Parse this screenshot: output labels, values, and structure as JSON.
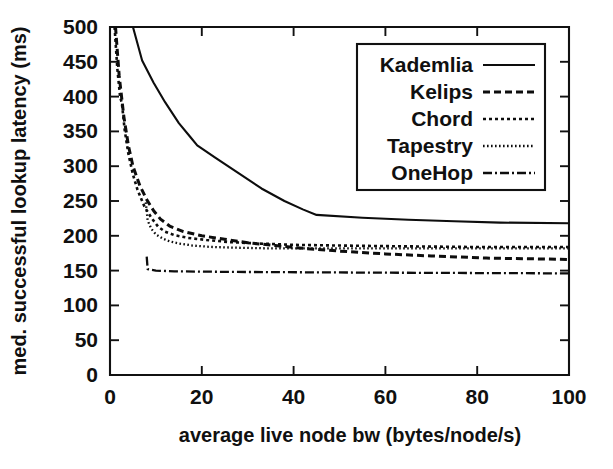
{
  "chart_data": {
    "type": "line",
    "title": "",
    "xlabel": "average live node bw (bytes/node/s)",
    "ylabel": "med. successful lookup latency (ms)",
    "xlim": [
      0,
      100
    ],
    "ylim": [
      0,
      500
    ],
    "xticks": [
      0,
      20,
      40,
      60,
      80,
      100
    ],
    "yticks": [
      0,
      50,
      100,
      150,
      200,
      250,
      300,
      350,
      400,
      450,
      500
    ],
    "xtick_labels": [
      "0",
      "20",
      "40",
      "60",
      "80",
      "100"
    ],
    "ytick_labels": [
      "0",
      "50",
      "100",
      "150",
      "200",
      "250",
      "300",
      "350",
      "400",
      "450",
      "500"
    ],
    "grid": false,
    "legend_position": "upper right",
    "series": [
      {
        "name": "Kademlia",
        "dash": "solid",
        "stroke_width": 2.1,
        "dasharray": "",
        "points": [
          [
            5.0,
            500.0
          ],
          [
            7.0,
            452.0
          ],
          [
            9.5,
            420.0
          ],
          [
            12.0,
            392.0
          ],
          [
            15.0,
            362.0
          ],
          [
            17.5,
            342.0
          ],
          [
            19.0,
            330.0
          ],
          [
            23.0,
            312.0
          ],
          [
            28.0,
            290.0
          ],
          [
            33.0,
            268.0
          ],
          [
            38.0,
            250.0
          ],
          [
            42.0,
            238.0
          ],
          [
            45.0,
            230.0
          ],
          [
            55.0,
            226.0
          ],
          [
            65.0,
            223.0
          ],
          [
            75.0,
            221.0
          ],
          [
            85.0,
            219.0
          ],
          [
            100.0,
            218.0
          ]
        ]
      },
      {
        "name": "Kelips",
        "dash": "dashed",
        "stroke_width": 3.0,
        "dasharray": "7,4",
        "points": [
          [
            1.2,
            500.0
          ],
          [
            2.0,
            430.0
          ],
          [
            3.0,
            372.0
          ],
          [
            4.0,
            330.0
          ],
          [
            5.0,
            300.0
          ],
          [
            6.5,
            272.0
          ],
          [
            8.0,
            252.0
          ],
          [
            9.5,
            236.0
          ],
          [
            11.0,
            224.0
          ],
          [
            13.0,
            214.0
          ],
          [
            16.0,
            206.0
          ],
          [
            20.0,
            200.0
          ],
          [
            25.0,
            195.0
          ],
          [
            30.0,
            190.0
          ],
          [
            36.0,
            186.0
          ],
          [
            42.0,
            182.0
          ],
          [
            50.0,
            178.0
          ],
          [
            60.0,
            174.0
          ],
          [
            70.0,
            171.0
          ],
          [
            82.0,
            168.0
          ],
          [
            100.0,
            166.0
          ]
        ]
      },
      {
        "name": "Chord",
        "dash": "dotted",
        "stroke_width": 2.6,
        "dasharray": "3,3",
        "points": [
          [
            1.0,
            500.0
          ],
          [
            1.6,
            440.0
          ],
          [
            2.2,
            400.0
          ],
          [
            2.6,
            390.0
          ],
          [
            3.2,
            352.0
          ],
          [
            4.0,
            318.0
          ],
          [
            5.0,
            288.0
          ],
          [
            6.0,
            266.0
          ],
          [
            7.5,
            242.0
          ],
          [
            9.0,
            226.0
          ],
          [
            10.5,
            213.0
          ],
          [
            12.0,
            206.0
          ],
          [
            14.0,
            201.0
          ],
          [
            17.0,
            197.0
          ],
          [
            21.0,
            194.0
          ],
          [
            26.0,
            191.0
          ],
          [
            32.0,
            189.0
          ],
          [
            40.0,
            187.0
          ],
          [
            50.0,
            186.0
          ],
          [
            62.0,
            185.0
          ],
          [
            78.0,
            184.0
          ],
          [
            100.0,
            184.0
          ]
        ]
      },
      {
        "name": "Tapestry",
        "dash": "fine-dotted",
        "stroke_width": 2.3,
        "dasharray": "1.6,2.4",
        "points": [
          [
            7.8,
            248.0
          ],
          [
            8.2,
            222.0
          ],
          [
            9.0,
            210.0
          ],
          [
            10.0,
            202.0
          ],
          [
            11.5,
            196.0
          ],
          [
            13.0,
            192.0
          ],
          [
            15.0,
            189.0
          ],
          [
            18.0,
            186.0
          ],
          [
            22.0,
            184.0
          ],
          [
            27.0,
            183.0
          ],
          [
            34.0,
            182.0
          ],
          [
            44.0,
            182.0
          ],
          [
            56.0,
            182.0
          ],
          [
            70.0,
            182.0
          ],
          [
            85.0,
            182.0
          ],
          [
            100.0,
            182.0
          ]
        ]
      },
      {
        "name": "OneHop",
        "dash": "dash-dot",
        "stroke_width": 2.3,
        "dasharray": "9,3,2,3",
        "points": [
          [
            8.0,
            170.0
          ],
          [
            8.2,
            152.0
          ],
          [
            10.0,
            150.0
          ],
          [
            14.0,
            149.0
          ],
          [
            20.0,
            148.5
          ],
          [
            30.0,
            148.0
          ],
          [
            45.0,
            147.5
          ],
          [
            60.0,
            147.0
          ],
          [
            80.0,
            146.5
          ],
          [
            100.0,
            146.0
          ]
        ]
      }
    ]
  },
  "legend": {
    "entries": [
      {
        "label": "Kademlia"
      },
      {
        "label": "Kelips"
      },
      {
        "label": "Chord"
      },
      {
        "label": "Tapestry"
      },
      {
        "label": "OneHop"
      }
    ]
  },
  "colors": {
    "ink": "#0d0d0d",
    "background": "#ffffff"
  }
}
